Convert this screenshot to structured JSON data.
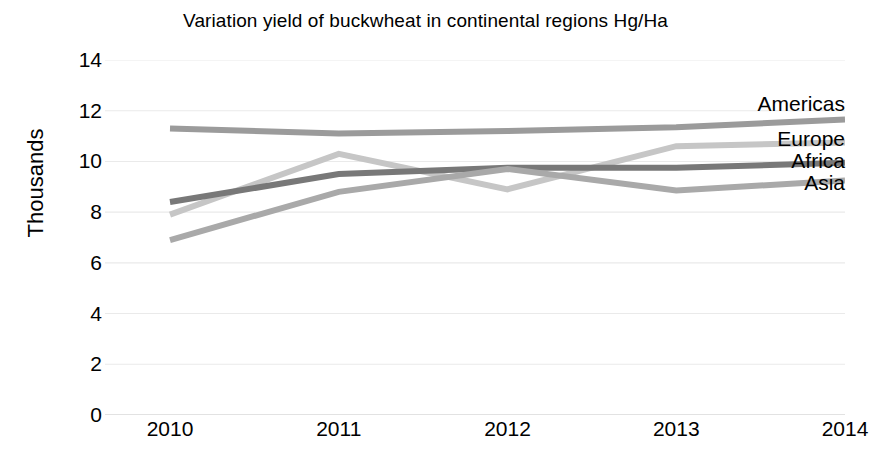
{
  "chart_data": {
    "type": "line",
    "title": "Variation yield of buckwheat in continental regions Hg/Ha",
    "xlabel": "",
    "ylabel": "Thousands",
    "categories": [
      "2010",
      "2011",
      "2012",
      "2013",
      "2014"
    ],
    "x": [
      2010,
      2011,
      2012,
      2013,
      2014
    ],
    "ylim": [
      0,
      14
    ],
    "ytick_step": 2,
    "yticks": [
      "14",
      "12",
      "10",
      "8",
      "6",
      "4",
      "2",
      "0"
    ],
    "ytick_values": [
      14,
      12,
      10,
      8,
      6,
      4,
      2,
      0
    ],
    "grid": true,
    "grid_axis": "y",
    "legend_position": "right-inline-labels",
    "series": [
      {
        "name": "Americas",
        "color": "#9b9b9b",
        "values": [
          11.3,
          11.1,
          11.2,
          11.35,
          11.65
        ]
      },
      {
        "name": "Europe",
        "color": "#c6c6c6",
        "values": [
          7.9,
          10.3,
          8.9,
          10.6,
          10.75
        ]
      },
      {
        "name": "Africa",
        "color": "#787878",
        "values": [
          8.4,
          9.5,
          9.75,
          9.75,
          9.95
        ]
      },
      {
        "name": "Asia",
        "color": "#a9a9a9",
        "values": [
          6.9,
          8.8,
          9.7,
          8.85,
          9.25
        ]
      }
    ],
    "series_label_positions": [
      {
        "name": "Americas",
        "top": 93
      },
      {
        "name": "Europe",
        "top": 128
      },
      {
        "name": "Africa",
        "top": 150
      },
      {
        "name": "Asia",
        "top": 172
      }
    ],
    "axis_color": "#d9d9d9",
    "grid_color": "#eaeaea",
    "background": "#ffffff"
  }
}
